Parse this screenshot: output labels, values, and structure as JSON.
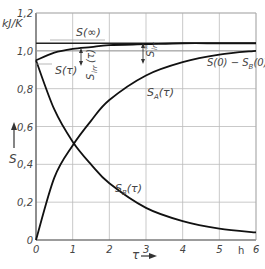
{
  "chart_data": {
    "type": "line",
    "title": "",
    "xlabel": "τ",
    "x_unit": "h",
    "ylabel": "S",
    "y_unit": "kJ/K",
    "xlim": [
      0,
      6
    ],
    "ylim": [
      0,
      1.2
    ],
    "x_ticks": [
      "0",
      "1",
      "2",
      "3",
      "4",
      "5",
      "6"
    ],
    "y_ticks": [
      "0",
      "0,2",
      "0,4",
      "0,6",
      "0,8",
      "1,0",
      "1,2"
    ],
    "grid": true,
    "series": [
      {
        "name": "S(τ)",
        "x": [
          0,
          0.5,
          1,
          1.5,
          2,
          3,
          4,
          5,
          6
        ],
        "y": [
          0.95,
          0.99,
          1.01,
          1.02,
          1.03,
          1.035,
          1.04,
          1.04,
          1.04
        ]
      },
      {
        "name": "S_A(τ)",
        "x": [
          0,
          0.5,
          1,
          1.5,
          2,
          3,
          4,
          5,
          6
        ],
        "y": [
          0,
          0.33,
          0.5,
          0.63,
          0.74,
          0.87,
          0.94,
          0.98,
          1.0
        ]
      },
      {
        "name": "S_B(τ)",
        "x": [
          0,
          0.5,
          1,
          1.5,
          2,
          3,
          4,
          5,
          6
        ],
        "y": [
          0.95,
          0.69,
          0.52,
          0.4,
          0.3,
          0.17,
          0.1,
          0.06,
          0.04
        ]
      }
    ],
    "reference_lines": [
      {
        "name": "S(∞)",
        "y": 1.04
      },
      {
        "name": "S(0) − S_B(0)",
        "y": 1.0
      }
    ],
    "annotations": [
      {
        "text": "S(∞)",
        "x": 1.8,
        "y": 1.1
      },
      {
        "text": "S(τ)",
        "x": 0.6,
        "y": 0.94
      },
      {
        "text": "S_irr(τ)",
        "x": 1.6,
        "y": 0.95
      },
      {
        "text": "S_irr^∞",
        "x": 3.1,
        "y": 1.0
      },
      {
        "text": "S(0) − S_B(0)",
        "x": 5.0,
        "y": 0.88
      },
      {
        "text": "S_A(τ)",
        "x": 3.1,
        "y": 0.74
      },
      {
        "text": "S_B(τ)",
        "x": 2.1,
        "y": 0.25
      }
    ]
  },
  "labels": {
    "y_unit": "kJ/K",
    "y_axis": "S",
    "x_axis": "τ",
    "x_unit": "h",
    "s_inf": "S(∞)",
    "s_tau": "S(τ)",
    "s_irr": "S",
    "s_irr_sub": "irr",
    "s_irr_arg": "(τ)",
    "s_irr_inf": "S",
    "s_irr_inf_sub": "irr",
    "s_irr_inf_sup": "∞",
    "s0_label": "S(0) − S",
    "s0_sub": "B",
    "s0_arg": "(0)",
    "sa": "S",
    "sa_sub": "A",
    "sa_arg": "(τ)",
    "sb": "S",
    "sb_sub": "B",
    "sb_arg": "(τ)"
  }
}
